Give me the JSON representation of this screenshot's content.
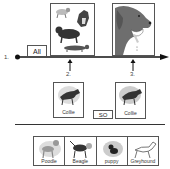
{
  "steps": {
    "step1": "1.",
    "step2": "2.",
    "step3": "3."
  },
  "timeline": {
    "start_label": "All",
    "connector_label": "SO"
  },
  "images": {
    "group_image": "dog-group-icon",
    "head_image": "dog-head-icon"
  },
  "collie_cards": [
    {
      "label": "Collie",
      "icon": "collie-icon"
    },
    {
      "label": "Collie",
      "icon": "collie-icon"
    }
  ],
  "choices": [
    {
      "label": "Poodle",
      "icon": "poodle-icon"
    },
    {
      "label": "Beagle",
      "icon": "beagle-icon"
    },
    {
      "label": "puppy",
      "icon": "puppy-icon"
    },
    {
      "label": "Greyhound",
      "icon": "greyhound-icon"
    }
  ],
  "colors": {
    "line": "#111111",
    "dog_gray": "#6e6e6e",
    "box_border": "#555555"
  }
}
